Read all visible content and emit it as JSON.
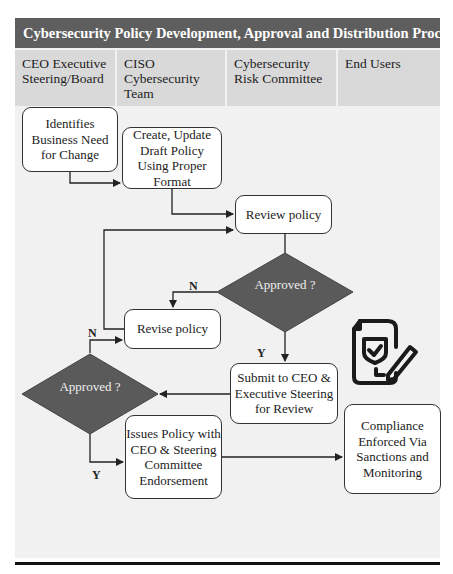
{
  "title": "Cybersecurity Policy Development, Approval and Distribution Process",
  "lanes": [
    {
      "label": "CEO Executive Steering/Board"
    },
    {
      "label": "CISO Cybersecurity Team"
    },
    {
      "label": "Cybersecurity Risk Committee"
    },
    {
      "label": "End Users"
    }
  ],
  "nodes": {
    "identify_need": "Identifies Business Need for Change",
    "create_draft": "Create, Update Draft Policy Using Proper Format",
    "review_policy": "Review policy",
    "decision_1": "Approved ?",
    "revise_policy": "Revise policy",
    "submit_ceo": "Submit to CEO & Executive Steering for Review",
    "decision_2": "Approved ?",
    "issue_policy": "Issues Policy with CEO & Steering Committee Endorsement",
    "compliance": "Compliance Enforced Via Sanctions and Monitoring"
  },
  "edge_labels": {
    "d1_no": "N",
    "d1_yes": "Y",
    "d2_no": "N",
    "d2_yes": "Y"
  },
  "colors": {
    "title_bg": "#5e5e5e",
    "lane_header_bg": "#d9d9d9",
    "diamond_fill": "#5a5a5a",
    "canvas_bg": "#f1f1f1"
  },
  "icons": {
    "document": "policy-document-check-pen-icon"
  }
}
